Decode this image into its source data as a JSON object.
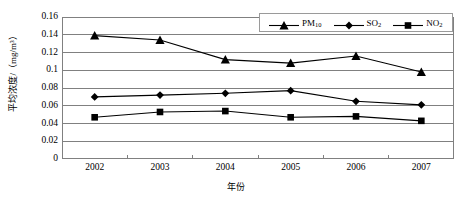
{
  "chart_data": {
    "type": "line",
    "title": "",
    "xlabel": "年份",
    "ylabel": "平均浓度/（mg/m³）",
    "categories": [
      "2002",
      "2003",
      "2004",
      "2005",
      "2006",
      "2007"
    ],
    "x": [
      2002,
      2003,
      2004,
      2005,
      2006,
      2007
    ],
    "ylim": [
      0,
      0.16
    ],
    "xlim": [
      2002,
      2007
    ],
    "yticks": [
      "0",
      "0.02",
      "0.04",
      "0.06",
      "0.08",
      "0.1",
      "0.12",
      "0.14",
      "0.16"
    ],
    "ytick_values": [
      0,
      0.02,
      0.04,
      0.06,
      0.08,
      0.1,
      0.12,
      0.14,
      0.16
    ],
    "grid": "horizontal",
    "legend_position": "top-right-inside",
    "series": [
      {
        "name": "PM10",
        "label_base": "PM",
        "label_sub": "10",
        "marker": "triangle",
        "color": "#000000",
        "values": [
          0.139,
          0.134,
          0.112,
          0.108,
          0.116,
          0.098
        ]
      },
      {
        "name": "SO2",
        "label_base": "SO",
        "label_sub": "2",
        "marker": "diamond",
        "color": "#000000",
        "values": [
          0.07,
          0.072,
          0.074,
          0.077,
          0.065,
          0.061
        ]
      },
      {
        "name": "NO2",
        "label_base": "NO",
        "label_sub": "2",
        "marker": "square",
        "color": "#000000",
        "values": [
          0.047,
          0.053,
          0.054,
          0.047,
          0.048,
          0.043
        ]
      }
    ],
    "colors": {
      "line": "#000000",
      "grid": "#808080",
      "axis": "#808080",
      "background": "#ffffff",
      "text": "#000000"
    }
  }
}
